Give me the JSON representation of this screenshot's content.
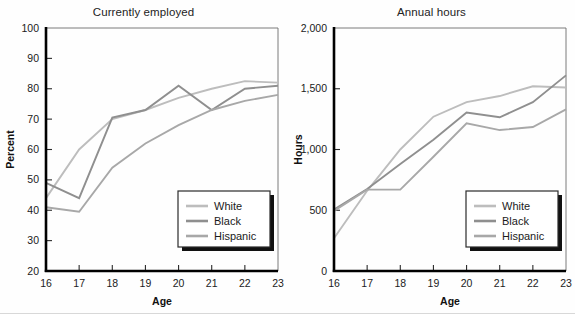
{
  "figure": {
    "background": "#fefefe",
    "axis_color": "#000000",
    "text_color": "#1b1b1b"
  },
  "series_styles": [
    {
      "name": "White",
      "color": "#bdbdbd",
      "width": 1.9
    },
    {
      "name": "Black",
      "color": "#8f8f8f",
      "width": 1.9
    },
    {
      "name": "Hispanic",
      "color": "#a8a8a8",
      "width": 1.9
    }
  ],
  "legend": {
    "position": "bottom-right",
    "entries": [
      "White",
      "Black",
      "Hispanic"
    ]
  },
  "chart_data": [
    {
      "id": "currently-employed",
      "type": "line",
      "title": "Currently employed",
      "xlabel": "Age",
      "ylabel": "Percent",
      "x": [
        16,
        17,
        18,
        19,
        20,
        21,
        22,
        23
      ],
      "xticklabels": [
        "16",
        "17",
        "18",
        "19",
        "20",
        "21",
        "22",
        "23"
      ],
      "xlim": [
        16,
        23
      ],
      "ylim": [
        20,
        100
      ],
      "yticks": [
        20,
        30,
        40,
        50,
        60,
        70,
        80,
        90,
        100
      ],
      "yticklabels": [
        "20",
        "30",
        "40",
        "50",
        "60",
        "70",
        "80",
        "90",
        "100"
      ],
      "grid": false,
      "legend_position": "bottom-right",
      "series": [
        {
          "name": "White",
          "values": [
            44,
            60,
            70,
            73,
            77,
            80,
            82.5,
            82
          ]
        },
        {
          "name": "Black",
          "values": [
            49,
            44,
            70.5,
            73,
            81,
            73,
            80,
            81
          ]
        },
        {
          "name": "Hispanic",
          "values": [
            41,
            39.5,
            54,
            62,
            68,
            73,
            76,
            78
          ]
        }
      ]
    },
    {
      "id": "annual-hours",
      "type": "line",
      "title": "Annual hours",
      "xlabel": "Age",
      "ylabel": "Hours",
      "x": [
        16,
        17,
        18,
        19,
        20,
        21,
        22,
        23
      ],
      "xticklabels": [
        "16",
        "17",
        "18",
        "19",
        "20",
        "21",
        "22",
        "23"
      ],
      "xlim": [
        16,
        23
      ],
      "ylim": [
        0,
        2000
      ],
      "yticks": [
        0,
        500,
        1000,
        1500,
        2000
      ],
      "yticklabels": [
        "0",
        "500",
        "1,000",
        "1,500",
        "2,000"
      ],
      "grid": false,
      "legend_position": "bottom-right",
      "series": [
        {
          "name": "White",
          "values": [
            270,
            660,
            1000,
            1270,
            1390,
            1440,
            1520,
            1510
          ]
        },
        {
          "name": "Black",
          "values": [
            505,
            675,
            880,
            1080,
            1305,
            1265,
            1390,
            1610
          ]
        },
        {
          "name": "Hispanic",
          "values": [
            495,
            670,
            670,
            940,
            1215,
            1160,
            1185,
            1330
          ]
        }
      ]
    }
  ]
}
